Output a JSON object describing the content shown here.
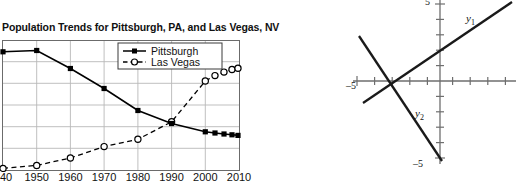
{
  "left_figure": {
    "title": "Population Trends for Pittsburgh, PA, and Las Vegas, NV",
    "legend": [
      {
        "label": "Pittsburgh",
        "style": "solid-filled-square-marker",
        "color": "#000000"
      },
      {
        "label": "Las Vegas",
        "style": "dashed-open-circle-marker",
        "color": "#000000"
      }
    ],
    "x_tick_labels": [
      "940",
      "1950",
      "1960",
      "1970",
      "1980",
      "1990",
      "2000",
      "2010"
    ],
    "x_tick_labels_full": [
      "1940",
      "1950",
      "1960",
      "1970",
      "1980",
      "1990",
      "2000",
      "2010"
    ],
    "y_tick_labels": [],
    "note_leftmost_label_clipped": "940"
  },
  "chart_data": {
    "type": "line",
    "title": "Population Trends for Pittsburgh, PA, and Las Vegas, NV",
    "xlabel": "",
    "ylabel": "",
    "xlim": [
      1940,
      2010
    ],
    "ylim": [
      0,
      700000
    ],
    "grid": true,
    "legend_position": "top-right-inside",
    "categories": [
      1940,
      1950,
      1960,
      1970,
      1980,
      1990,
      2000,
      2010
    ],
    "series": [
      {
        "name": "Pittsburgh",
        "marker": "filled-square",
        "line": "solid",
        "values": [
          672000,
          677000,
          604000,
          520000,
          424000,
          370000,
          335000,
          306000
        ]
      },
      {
        "name": "Las Vegas",
        "marker": "open-circle",
        "line": "dashed",
        "values": [
          8400,
          24600,
          64400,
          125800,
          164700,
          258300,
          478400,
          583800
        ]
      }
    ],
    "extra_points": {
      "Pittsburgh": [
        [
          2004,
          318000
        ],
        [
          2006,
          313000
        ],
        [
          2008,
          309000
        ],
        [
          2010,
          306000
        ]
      ],
      "Las Vegas": [
        [
          2004,
          535000
        ],
        [
          2006,
          558000
        ],
        [
          2008,
          572000
        ],
        [
          2010,
          584000
        ]
      ]
    }
  },
  "right_figure": {
    "type": "coordinate-plane",
    "axis_labels": {
      "y_top": "5",
      "y_bottom": "–5",
      "x_left": "–5"
    },
    "curve_labels": [
      {
        "name": "y1",
        "base": "y",
        "sub": "1"
      },
      {
        "name": "y2",
        "base": "y",
        "sub": "2"
      }
    ],
    "xlim": [
      -5,
      5
    ],
    "ylim": [
      -5,
      5
    ],
    "lines": [
      {
        "label": "y1",
        "slope": 0.62,
        "intercept": 1.55,
        "direction": "increasing"
      },
      {
        "label": "y2",
        "slope": -1.85,
        "intercept": -3.0,
        "direction": "decreasing"
      }
    ],
    "intersection": [
      -2.5,
      0.0
    ]
  }
}
